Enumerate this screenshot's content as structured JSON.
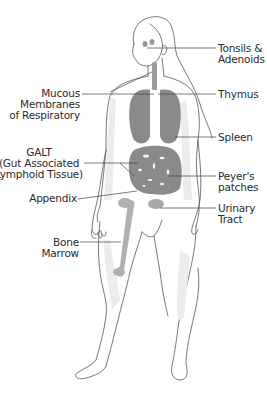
{
  "diagram": {
    "type": "anatomical-illustration",
    "colors": {
      "outline": "#555555",
      "organ_fill": "#8a8a8a",
      "skin_shade": "#e6e6e6",
      "label_text": "#2a2a2a",
      "leader_line": "#444444"
    },
    "labels": {
      "tonsils": {
        "line1": "Tonsils &",
        "line2": "Adenoids"
      },
      "mucous": {
        "line1": "Mucous",
        "line2": "Membranes",
        "line3": "of Respiratory"
      },
      "thymus": {
        "line1": "Thymus"
      },
      "spleen": {
        "line1": "Spleen"
      },
      "galt": {
        "line1": "GALT",
        "line2": "(Gut Associated",
        "line3": "Lymphoid Tissue)"
      },
      "peyers": {
        "line1": "Peyer's",
        "line2": "patches"
      },
      "appendix": {
        "line1": "Appendix"
      },
      "urinary": {
        "line1": "Urinary",
        "line2": "Tract"
      },
      "bone_marrow": {
        "line1": "Bone",
        "line2": "Marrow"
      }
    }
  }
}
